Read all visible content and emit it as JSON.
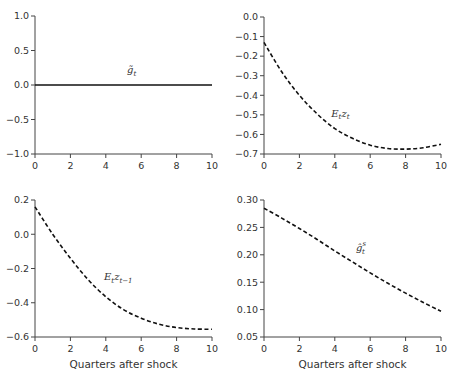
{
  "chart_data": [
    {
      "type": "line",
      "panel": "top-left",
      "title": "",
      "xlabel": "",
      "ylabel": "",
      "xlim": [
        0,
        10
      ],
      "ylim": [
        -1.0,
        1.0
      ],
      "xticks": [
        0,
        2,
        4,
        6,
        8,
        10
      ],
      "yticks": [
        -1.0,
        -0.5,
        0.0,
        0.5,
        1.0
      ],
      "ytick_labels": [
        "−1.0",
        "−0.5",
        "0.0",
        "0.5",
        "1.0"
      ],
      "grid": false,
      "series": [
        {
          "name": "g̃_t",
          "label_main": "g̃",
          "label_sub": "t",
          "label_sup": "",
          "style": "solid",
          "x": [
            0,
            1,
            2,
            3,
            4,
            5,
            6,
            7,
            8,
            9,
            10
          ],
          "values": [
            0,
            0,
            0,
            0,
            0,
            0,
            0,
            0,
            0,
            0,
            0
          ],
          "label_pos": [
            5.2,
            0.17
          ]
        }
      ]
    },
    {
      "type": "line",
      "panel": "top-right",
      "title": "",
      "xlabel": "",
      "ylabel": "",
      "xlim": [
        0,
        10
      ],
      "ylim": [
        -0.7,
        0.0
      ],
      "xticks": [
        0,
        2,
        4,
        6,
        8,
        10
      ],
      "yticks": [
        -0.7,
        -0.6,
        -0.5,
        -0.4,
        -0.3,
        -0.2,
        -0.1,
        0.0
      ],
      "ytick_labels": [
        "−0.7",
        "−0.6",
        "−0.5",
        "−0.4",
        "−0.3",
        "−0.2",
        "−0.1",
        "0.0"
      ],
      "grid": false,
      "series": [
        {
          "name": "E_t z_t",
          "label_main": "E",
          "label_sub": "t",
          "label_main2": "z",
          "label_sub2": "t",
          "style": "dashed",
          "x": [
            0,
            1,
            2,
            3,
            4,
            5,
            6,
            7,
            8,
            9,
            10
          ],
          "values": [
            -0.13,
            -0.28,
            -0.4,
            -0.495,
            -0.57,
            -0.62,
            -0.655,
            -0.672,
            -0.675,
            -0.668,
            -0.65
          ],
          "label_pos": [
            3.8,
            -0.51
          ]
        }
      ]
    },
    {
      "type": "line",
      "panel": "bottom-left",
      "title": "",
      "xlabel": "Quarters after shock",
      "ylabel": "",
      "xlim": [
        0,
        10
      ],
      "ylim": [
        -0.6,
        0.2
      ],
      "xticks": [
        0,
        2,
        4,
        6,
        8,
        10
      ],
      "yticks": [
        -0.6,
        -0.4,
        -0.2,
        0.0,
        0.2
      ],
      "ytick_labels": [
        "−0.6",
        "−0.4",
        "−0.2",
        "0.0",
        "0.2"
      ],
      "grid": false,
      "series": [
        {
          "name": "E_t z_{t−1}",
          "label_main": "E",
          "label_sub": "t",
          "label_main2": "z",
          "label_sub2": "t−1",
          "style": "dashed",
          "x": [
            0,
            1,
            2,
            3,
            4,
            5,
            6,
            7,
            8,
            9,
            10
          ],
          "values": [
            0.16,
            0.0,
            -0.14,
            -0.265,
            -0.365,
            -0.44,
            -0.49,
            -0.525,
            -0.545,
            -0.553,
            -0.555
          ],
          "label_pos": [
            3.9,
            -0.27
          ]
        }
      ]
    },
    {
      "type": "line",
      "panel": "bottom-right",
      "title": "",
      "xlabel": "Quarters after shock",
      "ylabel": "",
      "xlim": [
        0,
        10
      ],
      "ylim": [
        0.05,
        0.3
      ],
      "xticks": [
        0,
        2,
        4,
        6,
        8,
        10
      ],
      "yticks": [
        0.05,
        0.1,
        0.15,
        0.2,
        0.25,
        0.3
      ],
      "ytick_labels": [
        "0.05",
        "0.10",
        "0.15",
        "0.20",
        "0.25",
        "0.30"
      ],
      "grid": false,
      "series": [
        {
          "name": "ĝ_t^s",
          "label_main": "ĝ",
          "label_sub": "t",
          "label_sup": "s",
          "style": "dashed",
          "x": [
            0,
            1,
            2,
            3,
            4,
            5,
            6,
            7,
            8,
            9,
            10
          ],
          "values": [
            0.285,
            0.267,
            0.248,
            0.228,
            0.207,
            0.187,
            0.167,
            0.148,
            0.13,
            0.113,
            0.097
          ],
          "label_pos": [
            5.2,
            0.207
          ]
        }
      ]
    }
  ],
  "layout": {
    "panels": [
      {
        "x0": 35,
        "x1": 212,
        "y0": 16,
        "y1": 154
      },
      {
        "x0": 264,
        "x1": 441,
        "y0": 17,
        "y1": 154
      },
      {
        "x0": 35,
        "x1": 212,
        "y0": 200,
        "y1": 337
      },
      {
        "x0": 264,
        "x1": 441,
        "y0": 200,
        "y1": 337
      }
    ]
  }
}
